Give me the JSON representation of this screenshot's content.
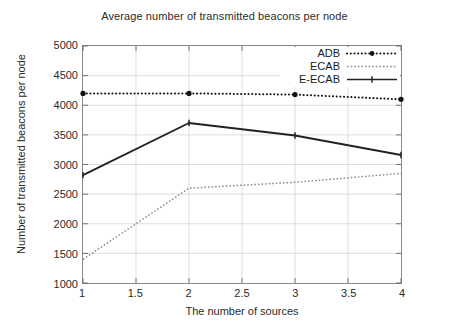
{
  "chart_data": {
    "type": "line",
    "title": "Average number of transmitted beacons per node",
    "xlabel": "The number of sources",
    "ylabel": "Number of transmitted beacons per node",
    "x": [
      1,
      2,
      3,
      4
    ],
    "xlim": [
      1,
      4
    ],
    "ylim": [
      1000,
      5000
    ],
    "xticks": [
      "1",
      "1.5",
      "2",
      "2.5",
      "3",
      "3.5",
      "4"
    ],
    "xtick_values": [
      1,
      1.5,
      2,
      2.5,
      3,
      3.5,
      4
    ],
    "yticks": [
      "1000",
      "1500",
      "2000",
      "2500",
      "3000",
      "3500",
      "4000",
      "4500",
      "5000"
    ],
    "ytick_values": [
      1000,
      1500,
      2000,
      2500,
      3000,
      3500,
      4000,
      4500,
      5000
    ],
    "grid": true,
    "legend_position": "top-right",
    "series": [
      {
        "name": "ADB",
        "values": [
          4200,
          4200,
          4180,
          4100
        ],
        "style": "dash-dot",
        "color": "#111111",
        "marker": "circle"
      },
      {
        "name": "ECAB",
        "values": [
          1400,
          2600,
          2700,
          2850
        ],
        "style": "dotted",
        "color": "#8e8e8e",
        "marker": "none"
      },
      {
        "name": "E-ECAB",
        "values": [
          2820,
          3700,
          3490,
          3160
        ],
        "style": "solid",
        "color": "#222222",
        "marker": "tick"
      }
    ]
  },
  "legend": {
    "items": [
      {
        "label": "ADB"
      },
      {
        "label": "ECAB"
      },
      {
        "label": "E-ECAB"
      }
    ]
  }
}
